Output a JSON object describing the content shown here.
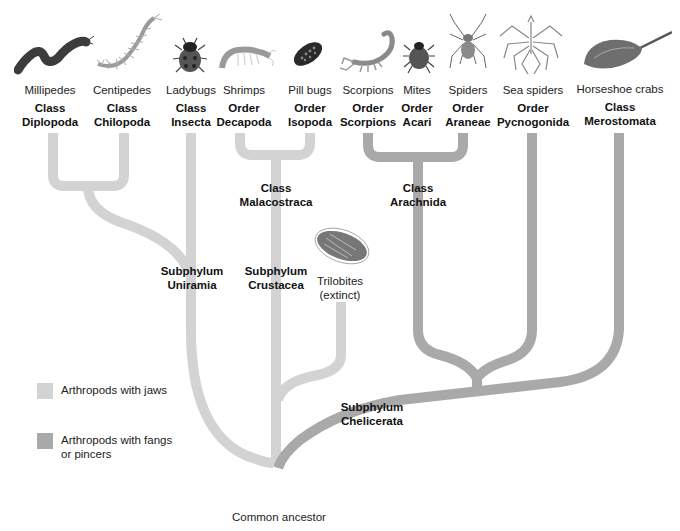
{
  "colors": {
    "jaws": "#d3d3d3",
    "fangs": "#a9a9a9",
    "root": "#8a8a8a",
    "text": "#111111"
  },
  "taxa": [
    {
      "common": "Millipedes",
      "rank": "Class",
      "name": "Diplopoda",
      "icon": "millipede-icon"
    },
    {
      "common": "Centipedes",
      "rank": "Class",
      "name": "Chilopoda",
      "icon": "centipede-icon"
    },
    {
      "common": "Ladybugs",
      "rank": "Class",
      "name": "Insecta",
      "icon": "ladybug-icon"
    },
    {
      "common": "Shrimps",
      "rank": "Order",
      "name": "Decapoda",
      "icon": "shrimp-icon"
    },
    {
      "common": "Pill bugs",
      "rank": "Order",
      "name": "Isopoda",
      "icon": "pill-bug-icon"
    },
    {
      "common": "Scorpions",
      "rank": "Order",
      "name": "Scorpions",
      "icon": "scorpion-icon"
    },
    {
      "common": "Mites",
      "rank": "Order",
      "name": "Acari",
      "icon": "mite-icon"
    },
    {
      "common": "Spiders",
      "rank": "Order",
      "name": "Araneae",
      "icon": "spider-icon"
    },
    {
      "common": "Sea spiders",
      "rank": "Order",
      "name": "Pycnogonida",
      "icon": "sea-spider-icon"
    },
    {
      "common": "Horseshoe crabs",
      "rank": "Class",
      "name": "Merostomata",
      "icon": "horseshoe-crab-icon"
    }
  ],
  "nodes": {
    "malacostraca": {
      "line1": "Class",
      "line2": "Malacostraca"
    },
    "arachnida": {
      "line1": "Class",
      "line2": "Arachnida"
    },
    "uniramia": {
      "line1": "Subphylum",
      "line2": "Uniramia"
    },
    "crustacea": {
      "line1": "Subphylum",
      "line2": "Crustacea"
    },
    "chelicerata": {
      "line1": "Subphylum",
      "line2": "Chelicerata"
    },
    "trilobites": {
      "line1": "Trilobites",
      "line2": "(extinct)"
    }
  },
  "root_label": "Common ancestor",
  "legend": [
    {
      "label_line1": "Arthropods with jaws",
      "label_line2": "",
      "color_key": "jaws"
    },
    {
      "label_line1": "Arthropods with fangs",
      "label_line2": "or pincers",
      "color_key": "fangs"
    }
  ]
}
